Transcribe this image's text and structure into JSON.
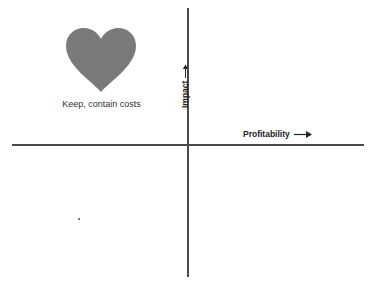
{
  "diagram": {
    "type": "quadrant-matrix",
    "x_axis": {
      "label": "Profitability",
      "arrow": "right-arrow"
    },
    "y_axis": {
      "label": "Impact",
      "arrow": "up-arrow"
    },
    "quadrants": [
      {
        "position": "top-left",
        "icon": "heart-icon",
        "caption": "Keep, contain costs",
        "icon_color": "#7a7a7a"
      }
    ],
    "colors": {
      "axis": "#4a4a4a",
      "heart": "#7a7a7a",
      "text": "#222222"
    }
  }
}
